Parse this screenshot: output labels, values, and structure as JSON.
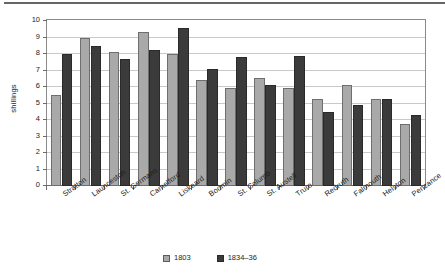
{
  "chart_data": {
    "type": "bar",
    "title": "",
    "subtitle": "",
    "xlabel": "",
    "ylabel": "shillings",
    "ylim": [
      0,
      10
    ],
    "ytick_step": 1,
    "yticks": [
      "10",
      "9",
      "8",
      "7",
      "6",
      "5",
      "4",
      "3",
      "2",
      "1",
      "0"
    ],
    "grid": true,
    "legend_position": "bottom",
    "categories": [
      "Stratton",
      "Launceston",
      "St. Germans",
      "Camelford",
      "Liskeard",
      "Bodmin",
      "St. Columb",
      "St. Austell",
      "Truro",
      "Redruth",
      "Falmouth",
      "Helston",
      "Penzance"
    ],
    "series": [
      {
        "name": "1803",
        "color": "#a9a9a9",
        "values": [
          5.5,
          9.0,
          8.1,
          9.35,
          8.0,
          6.45,
          5.95,
          6.55,
          5.95,
          5.3,
          6.15,
          5.25,
          3.75
        ]
      },
      {
        "name": "1834–36",
        "color": "#3b3b3b",
        "values": [
          8.0,
          8.5,
          7.7,
          8.25,
          9.55,
          7.1,
          7.8,
          6.15,
          7.9,
          4.5,
          4.9,
          5.25,
          4.3
        ]
      }
    ]
  },
  "legend": {
    "entries": [
      {
        "label": "1803",
        "swatch": "light-gray-swatch"
      },
      {
        "label": "1834–36",
        "swatch": "dark-gray-swatch"
      }
    ]
  }
}
